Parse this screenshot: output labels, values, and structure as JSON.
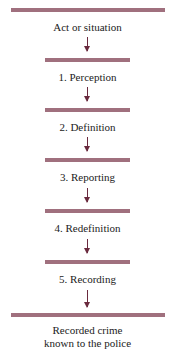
{
  "diagram": {
    "start_label": "Act or situation",
    "stages": [
      {
        "label": "1. Perception"
      },
      {
        "label": "2. Definition"
      },
      {
        "label": "3. Reporting"
      },
      {
        "label": "4. Redefinition"
      },
      {
        "label": "5. Recording"
      }
    ],
    "end_label_line1": "Recorded crime",
    "end_label_line2": "known to the police",
    "colors": {
      "bar": "#a0707e",
      "arrow": "#6a2a3e",
      "text": "#222222"
    }
  }
}
